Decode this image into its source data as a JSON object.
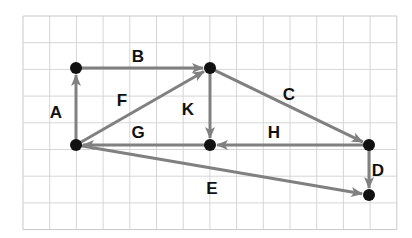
{
  "diagram": {
    "type": "directed-graph-on-grid",
    "grid": {
      "x0": 23,
      "y0": 16,
      "cols": 14,
      "rows": 8,
      "cell": 26.7,
      "line_color": "#d6d6d6",
      "border_color": "#c8c8c8"
    },
    "colors": {
      "edge": "#808080",
      "node": "#111111",
      "label": "#111111"
    },
    "nodes": [
      {
        "id": "P1",
        "x": 76,
        "y": 68
      },
      {
        "id": "P2",
        "x": 210,
        "y": 68
      },
      {
        "id": "P3",
        "x": 76,
        "y": 145
      },
      {
        "id": "P4",
        "x": 210,
        "y": 145
      },
      {
        "id": "P5",
        "x": 369,
        "y": 145
      },
      {
        "id": "P6",
        "x": 369,
        "y": 195
      }
    ],
    "edges": [
      {
        "label": "A",
        "from": "P3",
        "to": "P1",
        "label_x": 56,
        "label_y": 118
      },
      {
        "label": "B",
        "from": "P1",
        "to": "P2",
        "label_x": 138,
        "label_y": 62
      },
      {
        "label": "F",
        "from": "P3",
        "to": "P2",
        "label_x": 122,
        "label_y": 106
      },
      {
        "label": "K",
        "from": "P2",
        "to": "P4",
        "label_x": 188,
        "label_y": 115
      },
      {
        "label": "C",
        "from": "P2",
        "to": "P5",
        "label_x": 289,
        "label_y": 100
      },
      {
        "label": "H",
        "from": "P5",
        "to": "P4",
        "label_x": 274,
        "label_y": 138
      },
      {
        "label": "G",
        "from": "P4",
        "to": "P3",
        "label_x": 138,
        "label_y": 138
      },
      {
        "label": "D",
        "from": "P5",
        "to": "P6",
        "label_x": 378,
        "label_y": 176
      },
      {
        "label": "E",
        "from": "P3",
        "to": "P6",
        "label_x": 212,
        "label_y": 194
      }
    ]
  }
}
